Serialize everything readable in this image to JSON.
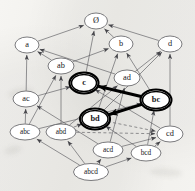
{
  "diagram": {
    "canvas": {
      "width": 195,
      "height": 191
    },
    "style": {
      "background": "#f3f2ef",
      "node_fill": "#ffffff",
      "node_stroke": "#4a4a4e",
      "node_stroke_bold": "#000000",
      "edge_color": "#55555a",
      "edge_color_bold": "#000000",
      "label_color": "#17161a"
    },
    "nodes": [
      {
        "id": "empty",
        "label": "Ø",
        "x": 96,
        "y": 21,
        "rx": 11.5,
        "ry": 8.0,
        "emphasis": "normal",
        "size": "normal"
      },
      {
        "id": "a",
        "label": "a",
        "x": 27,
        "y": 45,
        "rx": 12.0,
        "ry": 8.0,
        "emphasis": "normal",
        "size": "normal"
      },
      {
        "id": "b",
        "label": "b",
        "x": 121,
        "y": 44,
        "rx": 12.0,
        "ry": 8.0,
        "emphasis": "normal",
        "size": "normal"
      },
      {
        "id": "d",
        "label": "d",
        "x": 170,
        "y": 44,
        "rx": 12.0,
        "ry": 8.0,
        "emphasis": "normal",
        "size": "normal"
      },
      {
        "id": "ab",
        "label": "ab",
        "x": 61,
        "y": 66,
        "rx": 13.0,
        "ry": 8.0,
        "emphasis": "normal",
        "size": "normal"
      },
      {
        "id": "ad",
        "label": "ad",
        "x": 127,
        "y": 78,
        "rx": 13.0,
        "ry": 8.0,
        "emphasis": "normal",
        "size": "normal"
      },
      {
        "id": "c",
        "label": "c",
        "x": 84,
        "y": 83,
        "rx": 12.5,
        "ry": 8.5,
        "emphasis": "bold",
        "size": "normal"
      },
      {
        "id": "ac",
        "label": "ac",
        "x": 26,
        "y": 99,
        "rx": 13.0,
        "ry": 8.0,
        "emphasis": "normal",
        "size": "normal"
      },
      {
        "id": "bc",
        "label": "bc",
        "x": 156,
        "y": 100,
        "rx": 13.5,
        "ry": 8.5,
        "emphasis": "bold",
        "size": "normal"
      },
      {
        "id": "bd",
        "label": "bd",
        "x": 95,
        "y": 119,
        "rx": 13.0,
        "ry": 8.5,
        "emphasis": "bold",
        "size": "normal"
      },
      {
        "id": "abc",
        "label": "abc",
        "x": 25,
        "y": 132,
        "rx": 15.0,
        "ry": 8.0,
        "emphasis": "normal",
        "size": "small"
      },
      {
        "id": "abd",
        "label": "abd",
        "x": 61,
        "y": 132,
        "rx": 15.0,
        "ry": 8.0,
        "emphasis": "normal",
        "size": "small"
      },
      {
        "id": "cd",
        "label": "cd",
        "x": 170,
        "y": 134,
        "rx": 13.0,
        "ry": 8.0,
        "emphasis": "normal",
        "size": "normal"
      },
      {
        "id": "acd",
        "label": "acd",
        "x": 108,
        "y": 150,
        "rx": 15.0,
        "ry": 8.0,
        "emphasis": "normal",
        "size": "small"
      },
      {
        "id": "bcd",
        "label": "bcd",
        "x": 146,
        "y": 153,
        "rx": 15.0,
        "ry": 8.0,
        "emphasis": "normal",
        "size": "small"
      },
      {
        "id": "abcd",
        "label": "abcd",
        "x": 91,
        "y": 172,
        "rx": 17.5,
        "ry": 8.5,
        "emphasis": "normal",
        "size": "small"
      }
    ],
    "edges": [
      {
        "from": "a",
        "to": "empty",
        "style": "solid",
        "weight": "thin",
        "arrow": "to"
      },
      {
        "from": "b",
        "to": "empty",
        "style": "solid",
        "weight": "thin",
        "arrow": "to"
      },
      {
        "from": "d",
        "to": "empty",
        "style": "solid",
        "weight": "thin",
        "arrow": "to"
      },
      {
        "from": "c",
        "to": "empty",
        "style": "solid",
        "weight": "thin",
        "arrow": "to"
      },
      {
        "from": "ab",
        "to": "a",
        "style": "solid",
        "weight": "thin",
        "arrow": "to"
      },
      {
        "from": "ab",
        "to": "b",
        "style": "solid",
        "weight": "thin",
        "arrow": "to"
      },
      {
        "from": "ad",
        "to": "a",
        "style": "solid",
        "weight": "thin",
        "arrow": "to"
      },
      {
        "from": "ad",
        "to": "d",
        "style": "solid",
        "weight": "thin",
        "arrow": "to"
      },
      {
        "from": "ac",
        "to": "a",
        "style": "solid",
        "weight": "thin",
        "arrow": "to"
      },
      {
        "from": "ac",
        "to": "c",
        "style": "solid",
        "weight": "thin",
        "arrow": "to"
      },
      {
        "from": "bc",
        "to": "b",
        "style": "solid",
        "weight": "thin",
        "arrow": "to"
      },
      {
        "from": "bd",
        "to": "b",
        "style": "solid",
        "weight": "thin",
        "arrow": "to"
      },
      {
        "from": "bd",
        "to": "d",
        "style": "solid",
        "weight": "thin",
        "arrow": "to"
      },
      {
        "from": "cd",
        "to": "d",
        "style": "solid",
        "weight": "thin",
        "arrow": "to"
      },
      {
        "from": "cd",
        "to": "c",
        "style": "solid",
        "weight": "thin",
        "arrow": "to"
      },
      {
        "from": "abc",
        "to": "ab",
        "style": "solid",
        "weight": "thin",
        "arrow": "to"
      },
      {
        "from": "abc",
        "to": "ac",
        "style": "solid",
        "weight": "thin",
        "arrow": "to"
      },
      {
        "from": "abc",
        "to": "bc",
        "style": "solid",
        "weight": "thin",
        "arrow": "to"
      },
      {
        "from": "abd",
        "to": "ab",
        "style": "solid",
        "weight": "thin",
        "arrow": "to"
      },
      {
        "from": "abd",
        "to": "ad",
        "style": "solid",
        "weight": "thin",
        "arrow": "to"
      },
      {
        "from": "abd",
        "to": "bd",
        "style": "solid",
        "weight": "thin",
        "arrow": "to"
      },
      {
        "from": "acd",
        "to": "ac",
        "style": "solid",
        "weight": "thin",
        "arrow": "to"
      },
      {
        "from": "acd",
        "to": "ad",
        "style": "solid",
        "weight": "thin",
        "arrow": "to"
      },
      {
        "from": "acd",
        "to": "cd",
        "style": "solid",
        "weight": "thin",
        "arrow": "to"
      },
      {
        "from": "bcd",
        "to": "bc",
        "style": "solid",
        "weight": "thin",
        "arrow": "to"
      },
      {
        "from": "bcd",
        "to": "bd",
        "style": "solid",
        "weight": "thin",
        "arrow": "to"
      },
      {
        "from": "bcd",
        "to": "cd",
        "style": "solid",
        "weight": "thin",
        "arrow": "to"
      },
      {
        "from": "abcd",
        "to": "abc",
        "style": "solid",
        "weight": "thin",
        "arrow": "to"
      },
      {
        "from": "abcd",
        "to": "abd",
        "style": "solid",
        "weight": "thin",
        "arrow": "to"
      },
      {
        "from": "abcd",
        "to": "acd",
        "style": "solid",
        "weight": "thin",
        "arrow": "to"
      },
      {
        "from": "abcd",
        "to": "bcd",
        "style": "solid",
        "weight": "thin",
        "arrow": "to"
      },
      {
        "from": "abd",
        "to": "cd",
        "style": "dashed",
        "weight": "thin",
        "arrow": "to"
      },
      {
        "from": "bd",
        "to": "cd",
        "style": "dashed",
        "weight": "thin",
        "arrow": "to"
      },
      {
        "from": "bc",
        "to": "c",
        "style": "solid",
        "weight": "bold",
        "arrow": "to"
      },
      {
        "from": "bc",
        "to": "bd",
        "style": "solid",
        "weight": "bold",
        "arrow": "to"
      }
    ]
  }
}
